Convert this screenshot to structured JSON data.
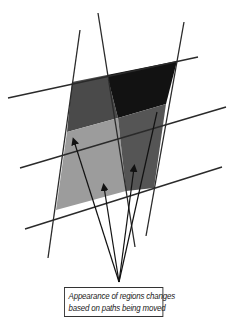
{
  "figure": {
    "caption_lines": [
      "Appearance of regions changes",
      "based  on paths being moved"
    ],
    "colors": {
      "background": "#ffffff",
      "line": "#2a2a2a",
      "region_top_left": "#4a4a4a",
      "region_top_right": "#111111",
      "region_bottom_left": "#9a9a9a",
      "region_bottom_right": "#555555",
      "arrow": "#111111"
    }
  }
}
